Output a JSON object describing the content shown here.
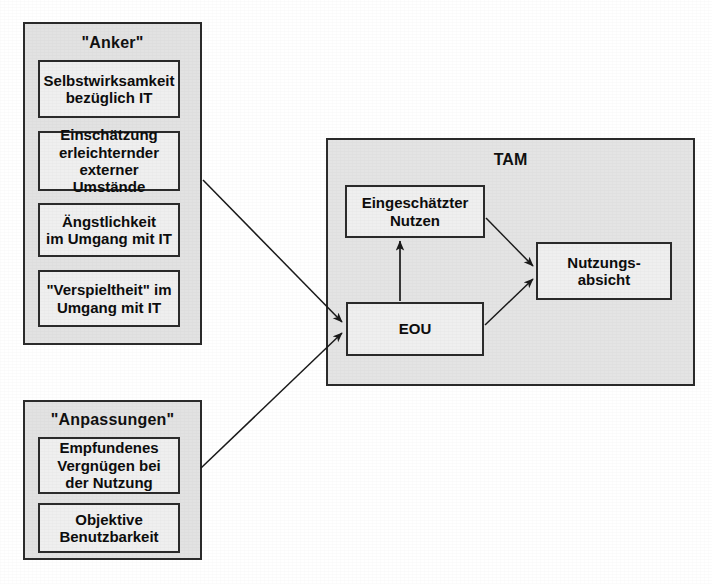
{
  "diagram": {
    "title_hidden": "",
    "groups": [
      {
        "id": "anker",
        "title": "\"Anker\"",
        "nodes": [
          {
            "id": "selbstwirksamkeit",
            "label": "Selbstwirksamkeit\nbezüglich IT"
          },
          {
            "id": "einschaetzung",
            "label": "Einschätzung\nerleichternder\nexterner Umstände"
          },
          {
            "id": "aengstlichkeit",
            "label": "Ängstlichkeit\nim Umgang mit IT"
          },
          {
            "id": "verspieltheit",
            "label": "\"Verspieltheit\" im\nUmgang mit IT"
          }
        ]
      },
      {
        "id": "anpassungen",
        "title": "\"Anpassungen\"",
        "nodes": [
          {
            "id": "empfundenes-vergnuegen",
            "label": "Empfundenes\nVergnügen bei\nder Nutzung"
          },
          {
            "id": "objektive-benutzbarkeit",
            "label": "Objektive\nBenutzbarkeit"
          }
        ]
      }
    ],
    "tam": {
      "title": "TAM",
      "nodes": [
        {
          "id": "eingeschaetzter-nutzen",
          "label": "Eingeschätzter\nNutzen"
        },
        {
          "id": "eou",
          "label": "EOU"
        },
        {
          "id": "nutzungsabsicht",
          "label": "Nutzungs-\nabsicht"
        }
      ]
    },
    "edges": [
      {
        "id": "anker-to-eou",
        "from": "anker",
        "to": "eou"
      },
      {
        "id": "anpassungen-to-eou",
        "from": "anpassungen",
        "to": "eou"
      },
      {
        "id": "eou-to-nutzen",
        "from": "eou",
        "to": "eingeschaetzter-nutzen"
      },
      {
        "id": "nutzen-to-absicht",
        "from": "eingeschaetzter-nutzen",
        "to": "nutzungsabsicht"
      },
      {
        "id": "eou-to-absicht",
        "from": "eou",
        "to": "nutzungsabsicht"
      }
    ],
    "colors": {
      "page_background": "#ffffff",
      "group_fill": "#e2e2e2",
      "node_fill": "#efefef",
      "tam_fill": "#e4e4e4",
      "stroke": "#2b2b2b",
      "text": "#0d0d0d"
    }
  }
}
